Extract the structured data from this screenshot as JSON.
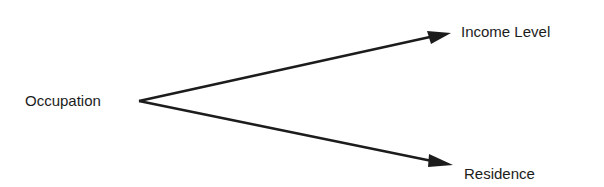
{
  "diagram": {
    "source": {
      "label": "Occupation"
    },
    "targets": [
      {
        "label": "Income Level"
      },
      {
        "label": "Residence"
      }
    ],
    "edges": [
      {
        "from": "Occupation",
        "to": "Income Level"
      },
      {
        "from": "Occupation",
        "to": "Residence"
      }
    ],
    "line_color": "#1c1c1c"
  }
}
